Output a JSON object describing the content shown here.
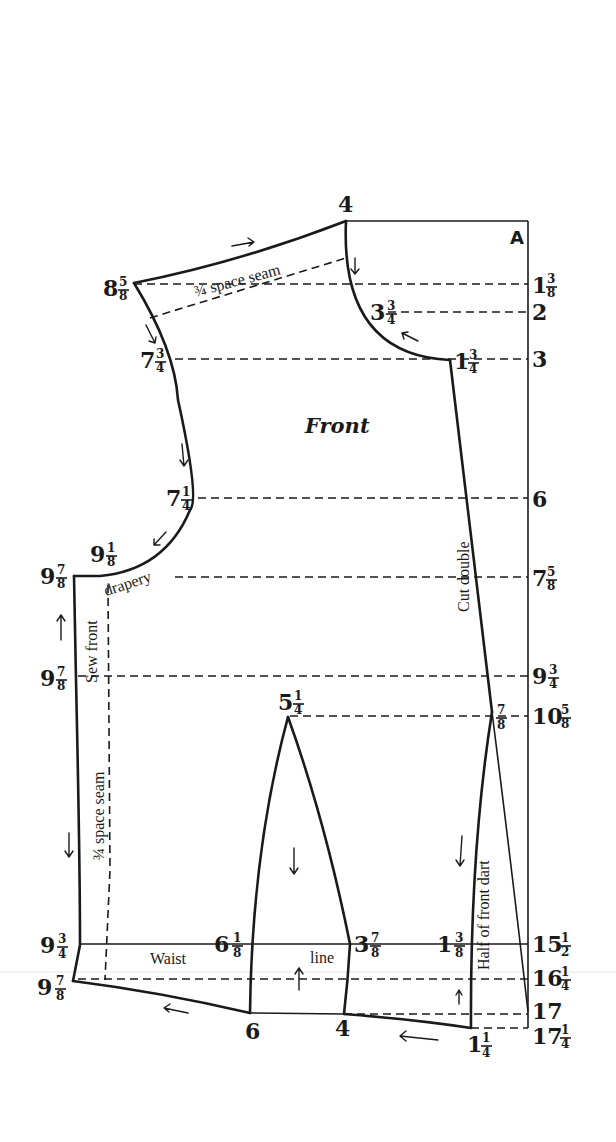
{
  "pattern": {
    "title": "Front",
    "corner_label": "A",
    "ink_color": "#1a1a1a",
    "background_color": "#ffffff"
  },
  "labels": {
    "shoulder_seam": "¾ space seam",
    "front_seam": "¾ space seam",
    "sew_front": "Sew front",
    "drapery": "drapery",
    "cut_double": "Cut double",
    "waist": "Waist",
    "line": "line",
    "half_front_dart": "Half of front dart"
  },
  "right_scale": [
    {
      "whole": "1",
      "num": "3",
      "den": "8"
    },
    {
      "whole": "2",
      "num": "",
      "den": ""
    },
    {
      "whole": "3",
      "num": "",
      "den": ""
    },
    {
      "whole": "6",
      "num": "",
      "den": ""
    },
    {
      "whole": "7",
      "num": "5",
      "den": "8"
    },
    {
      "whole": "9",
      "num": "3",
      "den": "4"
    },
    {
      "whole": "10",
      "num": "5",
      "den": "8"
    },
    {
      "whole": "15",
      "num": "1",
      "den": "2"
    },
    {
      "whole": "16",
      "num": "1",
      "den": "4"
    },
    {
      "whole": "17",
      "num": "",
      "den": ""
    },
    {
      "whole": "17",
      "num": "1",
      "den": "4"
    }
  ],
  "points": {
    "neck_top": {
      "whole": "4",
      "num": "",
      "den": ""
    },
    "shoulder": {
      "whole": "8",
      "num": "5",
      "den": "8"
    },
    "neck_mid": {
      "whole": "3",
      "num": "3",
      "den": "4"
    },
    "neck_bottom": {
      "whole": "1",
      "num": "3",
      "den": "4"
    },
    "armhole_1": {
      "whole": "7",
      "num": "3",
      "den": "4"
    },
    "armhole_2": {
      "whole": "7",
      "num": "1",
      "den": "4"
    },
    "armhole_3": {
      "whole": "9",
      "num": "1",
      "den": "8"
    },
    "underarm": {
      "whole": "9",
      "num": "7",
      "den": "8"
    },
    "side_mid": {
      "whole": "9",
      "num": "7",
      "den": "8"
    },
    "dart_top": {
      "whole": "5",
      "num": "1",
      "den": "4"
    },
    "front_dart_top": {
      "whole": "",
      "num": "7",
      "den": "8"
    },
    "side_waist": {
      "whole": "9",
      "num": "3",
      "den": "4"
    },
    "side_bottom": {
      "whole": "9",
      "num": "7",
      "den": "8"
    },
    "dart_left_waist": {
      "whole": "6",
      "num": "1",
      "den": "8"
    },
    "dart_right_waist": {
      "whole": "3",
      "num": "7",
      "den": "8"
    },
    "front_waist": {
      "whole": "1",
      "num": "3",
      "den": "8"
    },
    "dart_left_bottom": {
      "whole": "6",
      "num": "",
      "den": ""
    },
    "dart_right_bottom": {
      "whole": "4",
      "num": "",
      "den": ""
    },
    "front_bottom": {
      "whole": "1",
      "num": "1",
      "den": "4"
    }
  }
}
